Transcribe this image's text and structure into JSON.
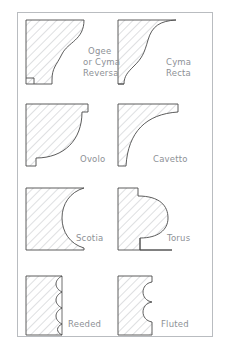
{
  "sheet": {
    "title": "Architectural Molding Profiles",
    "border_color": "#b9bcc0",
    "background": "#ffffff",
    "ink_color": "#4a4a4a",
    "hatch_color": "#b5b8bc",
    "label_color": "#8d9196",
    "columns": 2,
    "rows": 4
  },
  "profiles": [
    {
      "id": "ogee",
      "label_lines": [
        "Ogee",
        "or Cyma",
        "Reversa"
      ],
      "label_full": "Ogee or Cyma Reversa",
      "shape": "s-curve-convex-top-concave-bottom",
      "row": 1,
      "column": 1
    },
    {
      "id": "cyma-recta",
      "label_lines": [
        "Cyma",
        "Recta"
      ],
      "label_full": "Cyma Recta",
      "shape": "s-curve-concave-top-convex-bottom",
      "row": 1,
      "column": 2
    },
    {
      "id": "ovolo",
      "label_lines": [
        "Ovolo"
      ],
      "label_full": "Ovolo",
      "shape": "convex-quarter-round",
      "row": 2,
      "column": 1
    },
    {
      "id": "cavetto",
      "label_lines": [
        "Cavetto"
      ],
      "label_full": "Cavetto",
      "shape": "concave-quarter-hollow",
      "row": 2,
      "column": 2
    },
    {
      "id": "scotia",
      "label_lines": [
        "Scotia"
      ],
      "label_full": "Scotia",
      "shape": "deep-concave-hollow",
      "row": 3,
      "column": 1
    },
    {
      "id": "torus",
      "label_lines": [
        "Torus"
      ],
      "label_full": "Torus",
      "shape": "convex-half-round-bulge",
      "row": 3,
      "column": 2
    },
    {
      "id": "reeded",
      "label_lines": [
        "Reeded"
      ],
      "label_full": "Reeded",
      "shape": "repeated-convex-beads",
      "bead_count": 6,
      "row": 4,
      "column": 1
    },
    {
      "id": "fluted",
      "label_lines": [
        "Fluted"
      ],
      "label_full": "Fluted",
      "shape": "repeated-concave-flutes",
      "flute_count": 3,
      "row": 4,
      "column": 2
    }
  ]
}
